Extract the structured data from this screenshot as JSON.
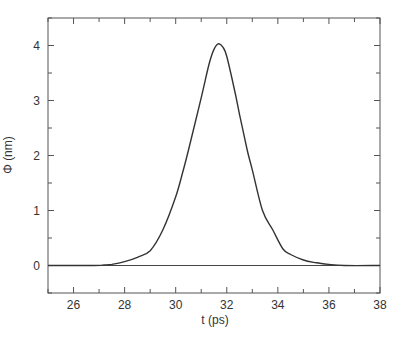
{
  "chart_data": {
    "type": "line",
    "title": "",
    "xlabel": "t (ps)",
    "ylabel": "Φ (nm)",
    "xlim": [
      25,
      38
    ],
    "ylim": [
      -0.5,
      4.5
    ],
    "xticks": [
      26,
      28,
      30,
      32,
      34,
      36,
      38
    ],
    "xtick_labels": [
      "26",
      "28",
      "30",
      "32",
      "34",
      "36",
      "38"
    ],
    "xminor_step": 1,
    "yticks": [
      0,
      1,
      2,
      3,
      4
    ],
    "ytick_labels": [
      "0",
      "1",
      "2",
      "3",
      "4"
    ],
    "yminor_step": 0.5,
    "grid": false,
    "legend": null,
    "baseline": 0,
    "series": [
      {
        "name": "Φ(t)",
        "color": "#333333",
        "x": [
          25.0,
          26.8,
          27.2,
          27.5,
          28.0,
          28.5,
          29.0,
          29.5,
          30.0,
          30.3,
          30.5,
          31.0,
          31.3,
          31.5,
          31.67,
          31.85,
          32.0,
          32.3,
          32.5,
          32.8,
          33.0,
          33.4,
          33.8,
          34.2,
          34.5,
          35.0,
          35.5,
          36.0,
          36.6,
          38.0
        ],
        "y": [
          0.0,
          0.0,
          0.01,
          0.02,
          0.07,
          0.15,
          0.27,
          0.65,
          1.25,
          1.74,
          2.1,
          3.05,
          3.65,
          3.93,
          4.03,
          3.97,
          3.8,
          3.2,
          2.75,
          2.1,
          1.74,
          1.0,
          0.65,
          0.3,
          0.2,
          0.1,
          0.05,
          0.02,
          0.0,
          0.0
        ]
      }
    ]
  }
}
